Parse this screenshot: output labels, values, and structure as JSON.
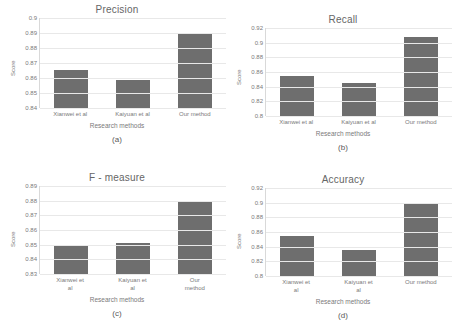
{
  "figure": {
    "background": "#ffffff",
    "bar_color": "#6e6e6e",
    "gridline_color": "#e8e8e8",
    "axis_color": "#d9d9d9",
    "text_color": "#7a7a7a"
  },
  "panels": [
    {
      "id": "a",
      "caption": "(a)",
      "xlabel": "Research methods",
      "ylabel": "Score",
      "label_wrap": false,
      "chart_data": {
        "type": "bar",
        "title": "Precision",
        "xlabel": "Research methods",
        "ylabel": "Score",
        "categories": [
          "Xianwei et al",
          "Kaiyuan et al",
          "Our method"
        ],
        "values": [
          0.8655,
          0.8585,
          0.8903
        ],
        "ylim": [
          0.84,
          0.9
        ],
        "yticks": [
          "0.9",
          "0.89",
          "0.88",
          "0.87",
          "0.86",
          "0.85",
          "0.84"
        ],
        "ytick_values": [
          0.9,
          0.89,
          0.88,
          0.87,
          0.86,
          0.85,
          0.84
        ],
        "grid": true,
        "legend": false
      }
    },
    {
      "id": "b",
      "caption": "(b)",
      "xlabel": "Research methods",
      "ylabel": "Score",
      "label_wrap": false,
      "chart_data": {
        "type": "bar",
        "title": "Recall",
        "xlabel": "Research methods",
        "ylabel": "Score",
        "categories": [
          "Xianwei et al",
          "Kaiyuan et al",
          "Our method"
        ],
        "values": [
          0.8545,
          0.8452,
          0.9082
        ],
        "ylim": [
          0.8,
          0.92
        ],
        "yticks": [
          "0.92",
          "0.9",
          "0.88",
          "0.86",
          "0.84",
          "0.82",
          "0.8"
        ],
        "ytick_values": [
          0.92,
          0.9,
          0.88,
          0.86,
          0.84,
          0.82,
          0.8
        ],
        "grid": true,
        "legend": false
      }
    },
    {
      "id": "c",
      "caption": "(c)",
      "xlabel": "Research methods",
      "ylabel": "Score",
      "label_wrap": true,
      "chart_data": {
        "type": "bar",
        "title": "F - measure",
        "xlabel": "Research methods",
        "ylabel": "Score",
        "categories": [
          "Xianwei et\nal",
          "Kaiyuan et\nal",
          "Our\nmethod"
        ],
        "values": [
          0.8495,
          0.8512,
          0.8801
        ],
        "ylim": [
          0.83,
          0.89
        ],
        "yticks": [
          "0.89",
          "0.88",
          "0.87",
          "0.86",
          "0.85",
          "0.84",
          "0.83"
        ],
        "ytick_values": [
          0.89,
          0.88,
          0.87,
          0.86,
          0.85,
          0.84,
          0.83
        ],
        "grid": true,
        "legend": false
      }
    },
    {
      "id": "d",
      "caption": "(d)",
      "xlabel": "Research methods",
      "ylabel": "Score",
      "label_wrap": true,
      "chart_data": {
        "type": "bar",
        "title": "Accuracy",
        "xlabel": "Research methods",
        "ylabel": "Score",
        "categories": [
          "Xianwei et\nal",
          "Kaiyuan et\nal",
          "Our method"
        ],
        "values": [
          0.8542,
          0.8352,
          0.8978
        ],
        "ylim": [
          0.8,
          0.92
        ],
        "yticks": [
          "0.92",
          "0.9",
          "0.88",
          "0.86",
          "0.84",
          "0.82",
          "0.8"
        ],
        "ytick_values": [
          0.92,
          0.9,
          0.88,
          0.86,
          0.84,
          0.82,
          0.8
        ],
        "grid": true,
        "legend": false
      }
    }
  ]
}
